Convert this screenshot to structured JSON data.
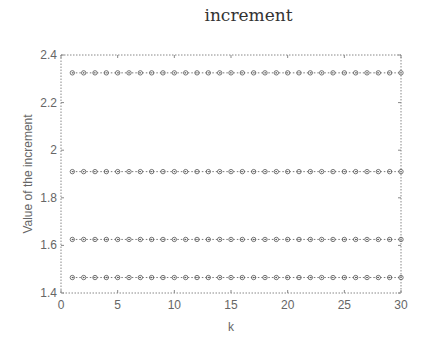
{
  "chart_data": {
    "type": "line",
    "title": "increment",
    "xlabel": "k",
    "ylabel": "Value of the increment",
    "xlim": [
      0,
      30
    ],
    "ylim": [
      1.4,
      2.4
    ],
    "xticks": [
      0,
      5,
      10,
      15,
      20,
      25,
      30
    ],
    "yticks": [
      1.4,
      1.6,
      1.8,
      2,
      2.2,
      2.4
    ],
    "ytick_labels": [
      "1.4",
      "1.6",
      "1.8",
      "2",
      "2.2",
      "2.4"
    ],
    "grid": false,
    "legend": null,
    "x": [
      1,
      2,
      3,
      4,
      5,
      6,
      7,
      8,
      9,
      10,
      11,
      12,
      13,
      14,
      15,
      16,
      17,
      18,
      19,
      20,
      21,
      22,
      23,
      24,
      25,
      26,
      27,
      28,
      29,
      30
    ],
    "series": [
      {
        "name": "series-1",
        "constant": 2.325,
        "values": [
          2.325,
          2.325,
          2.325,
          2.325,
          2.325,
          2.325,
          2.325,
          2.325,
          2.325,
          2.325,
          2.325,
          2.325,
          2.325,
          2.325,
          2.325,
          2.325,
          2.325,
          2.325,
          2.325,
          2.325,
          2.325,
          2.325,
          2.325,
          2.325,
          2.325,
          2.325,
          2.325,
          2.325,
          2.325,
          2.325
        ]
      },
      {
        "name": "series-2",
        "constant": 1.91,
        "values": [
          1.91,
          1.91,
          1.91,
          1.91,
          1.91,
          1.91,
          1.91,
          1.91,
          1.91,
          1.91,
          1.91,
          1.91,
          1.91,
          1.91,
          1.91,
          1.91,
          1.91,
          1.91,
          1.91,
          1.91,
          1.91,
          1.91,
          1.91,
          1.91,
          1.91,
          1.91,
          1.91,
          1.91,
          1.91,
          1.91
        ]
      },
      {
        "name": "series-3",
        "constant": 1.625,
        "values": [
          1.625,
          1.625,
          1.625,
          1.625,
          1.625,
          1.625,
          1.625,
          1.625,
          1.625,
          1.625,
          1.625,
          1.625,
          1.625,
          1.625,
          1.625,
          1.625,
          1.625,
          1.625,
          1.625,
          1.625,
          1.625,
          1.625,
          1.625,
          1.625,
          1.625,
          1.625,
          1.625,
          1.625,
          1.625,
          1.625
        ]
      },
      {
        "name": "series-4",
        "constant": 1.465,
        "values": [
          1.465,
          1.465,
          1.465,
          1.465,
          1.465,
          1.465,
          1.465,
          1.465,
          1.465,
          1.465,
          1.465,
          1.465,
          1.465,
          1.465,
          1.465,
          1.465,
          1.465,
          1.465,
          1.465,
          1.465,
          1.465,
          1.465,
          1.465,
          1.465,
          1.465,
          1.465,
          1.465,
          1.465,
          1.465,
          1.465
        ]
      }
    ],
    "style": {
      "line": "dotted",
      "marker": "circle-dot",
      "color": "#555555"
    }
  }
}
